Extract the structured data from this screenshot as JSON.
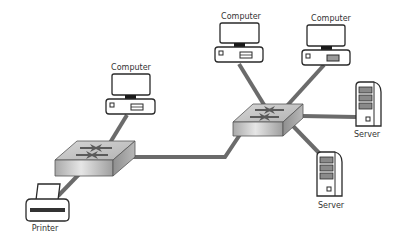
{
  "diagram": {
    "type": "network-topology",
    "colors": {
      "background": "#ffffff",
      "cable": "#6b6b6b",
      "outline": "#2a2a2a",
      "switch_top": "#c8c8c8",
      "switch_front": "#bdbdbd",
      "label": "#333333"
    },
    "nodes": [
      {
        "id": "computer-1",
        "kind": "computer",
        "label": "Computer",
        "icon": "desktop-computer-icon"
      },
      {
        "id": "computer-2",
        "kind": "computer",
        "label": "Computer",
        "icon": "desktop-computer-icon"
      },
      {
        "id": "computer-3",
        "kind": "computer",
        "label": "Computer",
        "icon": "desktop-computer-icon"
      },
      {
        "id": "server-1",
        "kind": "server",
        "label": "Server",
        "icon": "tower-server-icon"
      },
      {
        "id": "server-2",
        "kind": "server",
        "label": "Server",
        "icon": "tower-server-icon"
      },
      {
        "id": "printer-1",
        "kind": "printer",
        "label": "Printer",
        "icon": "printer-icon"
      },
      {
        "id": "switch-left",
        "kind": "switch",
        "label": "",
        "icon": "network-switch-icon"
      },
      {
        "id": "switch-right",
        "kind": "switch",
        "label": "",
        "icon": "network-switch-icon"
      }
    ],
    "links": [
      {
        "from": "computer-1",
        "to": "switch-left"
      },
      {
        "from": "printer-1",
        "to": "switch-left"
      },
      {
        "from": "switch-left",
        "to": "switch-right"
      },
      {
        "from": "computer-2",
        "to": "switch-right"
      },
      {
        "from": "computer-3",
        "to": "switch-right"
      },
      {
        "from": "server-1",
        "to": "switch-right"
      },
      {
        "from": "server-2",
        "to": "switch-right"
      }
    ]
  },
  "labels": {
    "computer_1": "Computer",
    "computer_2": "Computer",
    "computer_3": "Computer",
    "server_1": "Server",
    "server_2": "Server",
    "printer": "Printer"
  }
}
